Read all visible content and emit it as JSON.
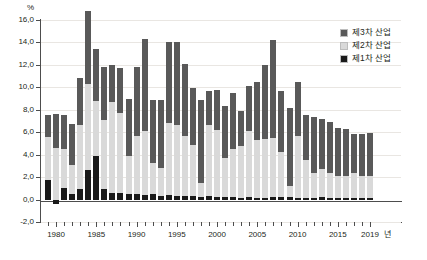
{
  "chart_data": {
    "type": "bar",
    "stacked": true,
    "title": "",
    "subtitle": "",
    "xlabel": "년",
    "ylabel": "%",
    "ylim": [
      -2.0,
      16.0
    ],
    "ytick_step": 2.0,
    "ytick_labels": [
      "16,0",
      "14,0",
      "12,0",
      "10,0",
      "8,0",
      "6,0",
      "4,0",
      "2,0",
      "0,0",
      "-2,0"
    ],
    "ytick_values": [
      16.0,
      14.0,
      12.0,
      10.0,
      8.0,
      6.0,
      4.0,
      2.0,
      0.0,
      -2.0
    ],
    "xtick_labels": [
      "1980",
      "1985",
      "1990",
      "1995",
      "2000",
      "2005",
      "2010",
      "2015",
      "2019"
    ],
    "xtick_values": [
      1980,
      1985,
      1990,
      1995,
      2000,
      2005,
      2010,
      2015,
      2019
    ],
    "grid": true,
    "grid_axis": "y",
    "legend_position": "top-right",
    "colors": {
      "primary": "#1a1a1a",
      "secondary": "#d9d9d9",
      "tertiary": "#595959",
      "grid": "#e9e6e2",
      "axis": "#4d4d4d",
      "text": "#231f20",
      "background": "#ffffff"
    },
    "x": [
      1979,
      1980,
      1981,
      1982,
      1983,
      1984,
      1985,
      1986,
      1987,
      1988,
      1989,
      1990,
      1991,
      1992,
      1993,
      1994,
      1995,
      1996,
      1997,
      1998,
      1999,
      2000,
      2001,
      2002,
      2003,
      2004,
      2005,
      2006,
      2007,
      2008,
      2009,
      2010,
      2011,
      2012,
      2013,
      2014,
      2015,
      2016,
      2017,
      2018,
      2019
    ],
    "series": [
      {
        "name": "제1차 산업",
        "key": "primary",
        "color": "#1a1a1a",
        "values": [
          1.7,
          -0.4,
          1.0,
          0.5,
          0.9,
          2.6,
          3.9,
          0.9,
          0.6,
          0.6,
          0.5,
          0.5,
          0.4,
          0.5,
          0.3,
          0.4,
          0.3,
          0.3,
          0.3,
          0.2,
          0.3,
          0.2,
          0.2,
          0.2,
          0.1,
          0.2,
          0.1,
          0.1,
          0.2,
          0.2,
          0.2,
          0.1,
          0.1,
          0.1,
          0.2,
          0.1,
          0.1,
          0.1,
          0.1,
          0.1,
          0.1
        ]
      },
      {
        "name": "제2차 산업",
        "key": "secondary",
        "color": "#d9d9d9",
        "values": [
          3.9,
          4.6,
          3.5,
          2.6,
          5.7,
          7.7,
          4.9,
          6.2,
          8.1,
          7.1,
          3.4,
          5.2,
          5.7,
          2.8,
          2.5,
          6.4,
          6.3,
          5.4,
          4.6,
          1.3,
          6.3,
          6.0,
          3.5,
          4.3,
          4.7,
          5.9,
          5.2,
          5.3,
          5.3,
          4.0,
          1.0,
          5.6,
          3.4,
          2.3,
          2.5,
          2.3,
          2.0,
          2.0,
          2.3,
          2.0,
          2.0
        ]
      },
      {
        "name": "제3차 산업",
        "key": "tertiary",
        "color": "#595959",
        "values": [
          1.9,
          3.0,
          3.0,
          3.6,
          4.2,
          6.5,
          4.6,
          4.7,
          3.3,
          4.0,
          5.1,
          6.1,
          8.2,
          5.6,
          6.1,
          7.2,
          7.4,
          6.4,
          5.0,
          7.4,
          3.1,
          3.6,
          4.6,
          5.0,
          3.1,
          4.0,
          5.2,
          6.6,
          8.7,
          5.5,
          7.0,
          4.8,
          4.0,
          5.0,
          4.5,
          4.5,
          4.3,
          4.2,
          3.4,
          3.7,
          3.8
        ]
      }
    ]
  },
  "legend": {
    "items": [
      {
        "label": "제3차 산업",
        "key": "tertiary"
      },
      {
        "label": "제2차 산업",
        "key": "secondary"
      },
      {
        "label": "제1차 산업",
        "key": "primary"
      }
    ]
  }
}
